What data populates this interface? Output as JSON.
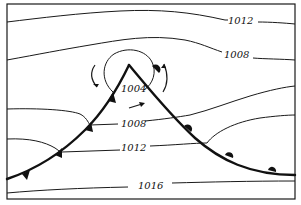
{
  "diagram": {
    "type": "weather-map-occlusion-sketch",
    "isobars": [
      {
        "label": "1012",
        "position": "top"
      },
      {
        "label": "1008",
        "position": "upper"
      },
      {
        "label": "1004",
        "position": "low-center"
      },
      {
        "label": "1008",
        "position": "warm-sector"
      },
      {
        "label": "1012",
        "position": "warm-sector-lower"
      },
      {
        "label": "1016",
        "position": "bottom"
      }
    ],
    "fronts": {
      "cold_front": {
        "symbol": "triangles",
        "count": 4
      },
      "warm_front": {
        "symbol": "semicircles",
        "count": 4
      }
    },
    "circulation": "counterclockwise-arrows-around-low",
    "colors": {
      "ink": "#111111",
      "background": "#ffffff"
    }
  }
}
